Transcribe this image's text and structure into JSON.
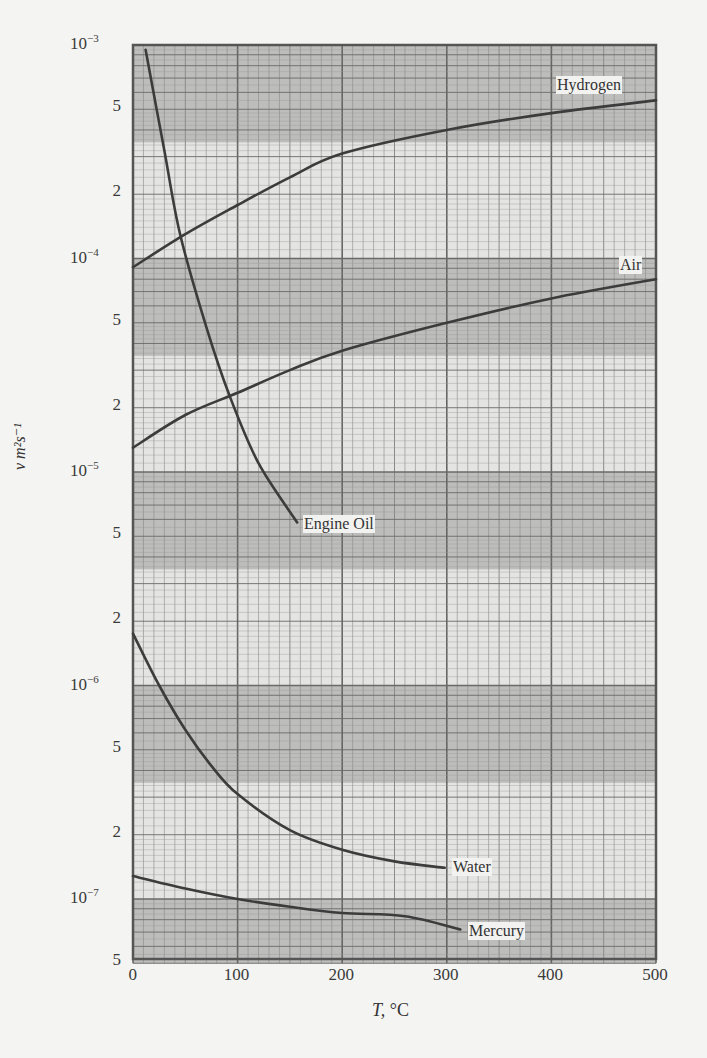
{
  "chart_data": {
    "type": "line",
    "title": "",
    "xlabel": "T, °C",
    "ylabel": "ν m² s⁻¹",
    "xscale": "linear",
    "yscale": "log",
    "xlim": [
      0,
      500
    ],
    "ylim": [
      5e-08,
      0.001
    ],
    "grid": true,
    "x_ticks": [
      "0",
      "100",
      "200",
      "300",
      "400",
      "500"
    ],
    "y_ticks": [
      {
        "value": 0.001,
        "label": "10",
        "exp": "−3"
      },
      {
        "value": 0.0005,
        "label": "5"
      },
      {
        "value": 0.0002,
        "label": "2"
      },
      {
        "value": 0.0001,
        "label": "10",
        "exp": "−4"
      },
      {
        "value": 5e-05,
        "label": "5"
      },
      {
        "value": 2e-05,
        "label": "2"
      },
      {
        "value": 1e-05,
        "label": "10",
        "exp": "−5"
      },
      {
        "value": 5e-06,
        "label": "5"
      },
      {
        "value": 2e-06,
        "label": "2"
      },
      {
        "value": 1e-06,
        "label": "10",
        "exp": "−6"
      },
      {
        "value": 5e-07,
        "label": "5"
      },
      {
        "value": 2e-07,
        "label": "2"
      },
      {
        "value": 1e-07,
        "label": "10",
        "exp": "−7"
      },
      {
        "value": 5e-08,
        "label": "5"
      }
    ],
    "series": [
      {
        "name": "Hydrogen",
        "x": [
          0,
          50,
          100,
          150,
          200,
          300,
          400,
          500
        ],
        "values": [
          9.1e-05,
          0.00013,
          0.000178,
          0.00024,
          0.00031,
          0.0004,
          0.00048,
          0.00055
        ]
      },
      {
        "name": "Air",
        "x": [
          0,
          50,
          100,
          150,
          200,
          300,
          400,
          500
        ],
        "values": [
          1.3e-05,
          1.85e-05,
          2.35e-05,
          3e-05,
          3.7e-05,
          5e-05,
          6.5e-05,
          8e-05
        ]
      },
      {
        "name": "Engine Oil",
        "x": [
          12,
          30,
          45,
          70,
          92,
          120,
          157
        ],
        "values": [
          0.00095,
          0.00032,
          0.00013,
          4.8e-05,
          2.3e-05,
          1.1e-05,
          5.8e-06
        ]
      },
      {
        "name": "Water",
        "x": [
          0,
          25,
          50,
          75,
          100,
          150,
          200,
          250,
          298
        ],
        "values": [
          1.75e-06,
          1e-06,
          6.2e-07,
          4.2e-07,
          3.1e-07,
          2.1e-07,
          1.7e-07,
          1.5e-07,
          1.4e-07
        ]
      },
      {
        "name": "Mercury",
        "x": [
          0,
          50,
          100,
          150,
          200,
          260,
          313
        ],
        "values": [
          1.28e-07,
          1.12e-07,
          1e-07,
          9.2e-08,
          8.6e-08,
          8.3e-08,
          7.2e-08
        ]
      }
    ],
    "annotations": [
      "Hydrogen",
      "Air",
      "Engine Oil",
      "Water",
      "Mercury"
    ]
  },
  "labels": {
    "x_title_var": "T,",
    "x_title_unit": " °C",
    "y_title": "ν m²s⁻¹",
    "hydrogen": "Hydrogen",
    "air": "Air",
    "engine_oil": "Engine Oil",
    "water": "Water",
    "mercury": "Mercury"
  }
}
